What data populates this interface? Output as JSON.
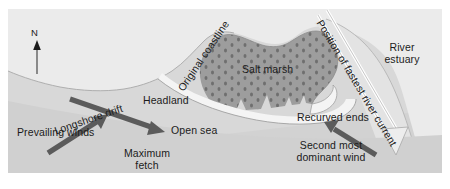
{
  "figure": {
    "background_color": "#dcdcdc",
    "border_color": "#ffffff"
  },
  "colors": {
    "land": "#ebebeb",
    "sea": "#d2d2d2",
    "sea_light": "#dedede",
    "salt_marsh": "#9d9d9d",
    "salt_marsh_dots": "#6f6f6f",
    "spit": "#f4f4f4",
    "estuary": "#e2e2e2",
    "arrow_dark": "#5b5b5b",
    "outline": "#8c8c8c",
    "text": "#1b1b1b"
  },
  "compass": {
    "label": "N",
    "icon": "north-arrow-icon"
  },
  "labels": {
    "original_coastline": "Original coastline",
    "salt_marsh": "Salt marsh",
    "headland": "Headland",
    "longshore_drift": "Longshore drift",
    "prevailing_winds": "Prevailing winds",
    "maximum_fetch": "Maximum\nfetch",
    "maximum_fetch_line1": "Maximum",
    "maximum_fetch_line2": "fetch",
    "open_sea": "Open sea",
    "recurved_ends": "Recurved ends",
    "second_most_dominant_wind_line1": "Second most",
    "second_most_dominant_wind_line2": "dominant wind",
    "position_of_fastest_river_current": "Position of fastest river current",
    "river_estuary_line1": "River",
    "river_estuary_line2": "estuary"
  },
  "annotations": [
    {
      "name": "longshore-drift-arrow",
      "kind": "solid-arrow",
      "direction": "down-right",
      "color": "#5b5b5b",
      "label": "Longshore drift"
    },
    {
      "name": "prevailing-winds-arrow",
      "kind": "solid-arrow",
      "direction": "up-right",
      "color": "#5b5b5b",
      "label": "Prevailing winds"
    },
    {
      "name": "second-most-dominant-wind-arrow",
      "kind": "solid-arrow",
      "direction": "up-left",
      "color": "#5b5b5b",
      "label": "Second most dominant wind"
    },
    {
      "name": "fastest-river-current-arrow",
      "kind": "hollow-outline-arrow",
      "direction": "down-right",
      "color": "#ffffff",
      "label": "Position of fastest river current"
    }
  ],
  "regions": [
    {
      "name": "land-region",
      "label": "Headland"
    },
    {
      "name": "salt-marsh-region",
      "label": "Salt marsh"
    },
    {
      "name": "open-sea-region",
      "label": "Open sea"
    },
    {
      "name": "river-estuary-region",
      "label": "River estuary"
    },
    {
      "name": "spit-region",
      "label": "Recurved ends"
    }
  ]
}
